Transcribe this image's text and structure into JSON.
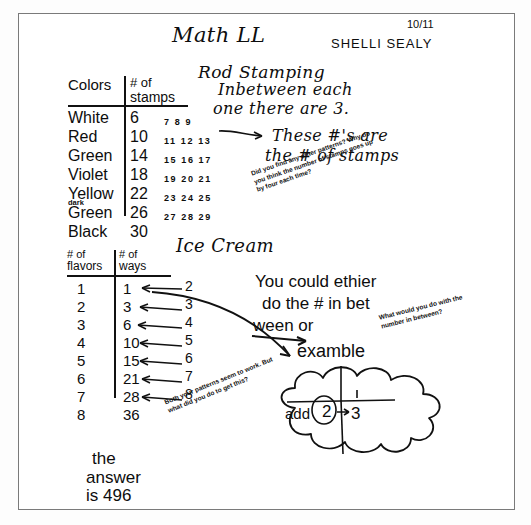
{
  "document": {
    "subject_title": "Math LL",
    "student_name": "SHELLI SEALY",
    "date": "10/11"
  },
  "rod_stamping": {
    "heading": "Rod Stamping",
    "note_line1": "Inbetween each",
    "note_line2": "one there are 3.",
    "table": {
      "header_col1": "Colors",
      "header_col2_line1": "# of",
      "header_col2_line2": "stamps",
      "rows": [
        {
          "color": "White",
          "stamps": "6",
          "between": "7 8 9",
          "sublabel": ""
        },
        {
          "color": "Red",
          "stamps": "10",
          "between": "11 12 13",
          "sublabel": ""
        },
        {
          "color": "Green",
          "stamps": "14",
          "between": "15 16 17",
          "sublabel": ""
        },
        {
          "color": "Violet",
          "stamps": "18",
          "between": "19 20 21",
          "sublabel": ""
        },
        {
          "color": "Yellow",
          "stamps": "22",
          "between": "23 24 25",
          "sublabel": ""
        },
        {
          "color": "Green",
          "stamps": "26",
          "between": "27 28 29",
          "sublabel": "dark"
        },
        {
          "color": "Black",
          "stamps": "30",
          "between": "",
          "sublabel": ""
        }
      ]
    },
    "callout_line1": "These #'s are",
    "callout_line2": "the # of stamps",
    "teacher_note": "Did you find any other patterns? Why do you think the number of stamps goes up by four each time?"
  },
  "ice_cream": {
    "heading": "Ice Cream",
    "table": {
      "header_col1_line1": "# of",
      "header_col1_line2": "flavors",
      "header_col2_line1": "# of",
      "header_col2_line2": "ways",
      "rows": [
        {
          "flavors": "1",
          "ways": "1",
          "difference": "2"
        },
        {
          "flavors": "2",
          "ways": "3",
          "difference": "3"
        },
        {
          "flavors": "3",
          "ways": "6",
          "difference": "4"
        },
        {
          "flavors": "4",
          "ways": "10",
          "difference": "5"
        },
        {
          "flavors": "5",
          "ways": "15",
          "difference": "6"
        },
        {
          "flavors": "6",
          "ways": "21",
          "difference": "7"
        },
        {
          "flavors": "7",
          "ways": "28",
          "difference": "8"
        },
        {
          "flavors": "8",
          "ways": "36",
          "difference": ""
        }
      ]
    },
    "teacher_comment_line1": "You could ethier",
    "teacher_comment_line2": "do the # in bet",
    "teacher_comment_line3": "ween or",
    "example_label": "examble",
    "teacher_note_side": "What would you do with the number in between?",
    "teacher_note_bottom": "Both your patterns seem to work. But what did you do to get this?",
    "cloud": {
      "add_label": "add",
      "first_number": "2",
      "second_number": "3"
    }
  },
  "answer": {
    "line1": "the",
    "line2": "answer",
    "line3": "is 496"
  },
  "colors": {
    "ink": "#0d0d0d",
    "paper": "#ffffff",
    "border": "#7a7a7a"
  }
}
